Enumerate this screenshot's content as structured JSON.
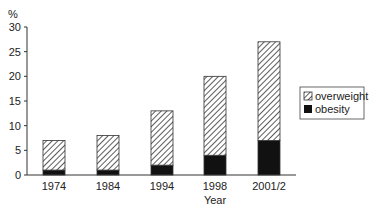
{
  "chart_data": {
    "type": "bar",
    "stacked": true,
    "title": "",
    "xlabel": "Year",
    "ylabel": "%",
    "ylim": [
      0,
      30
    ],
    "yticks": [
      0,
      5,
      10,
      15,
      20,
      25,
      30
    ],
    "categories": [
      "1974",
      "1984",
      "1994",
      "1998",
      "2001/2"
    ],
    "series": [
      {
        "name": "obesity",
        "values": [
          1,
          1,
          2,
          4,
          7
        ],
        "fill": "solid",
        "color": "#111111"
      },
      {
        "name": "overweight",
        "values": [
          6,
          7,
          11,
          16,
          20
        ],
        "fill": "hatched",
        "color": "#333333"
      }
    ],
    "totals": [
      7,
      8,
      13,
      20,
      27
    ],
    "legend": {
      "position": "right",
      "entries": [
        "overweight",
        "obesity"
      ]
    },
    "grid": false
  },
  "legend": {
    "overweight": "overweight",
    "obesity": "obesity"
  },
  "axis": {
    "xlabel": "Year",
    "ylabel": "%"
  }
}
